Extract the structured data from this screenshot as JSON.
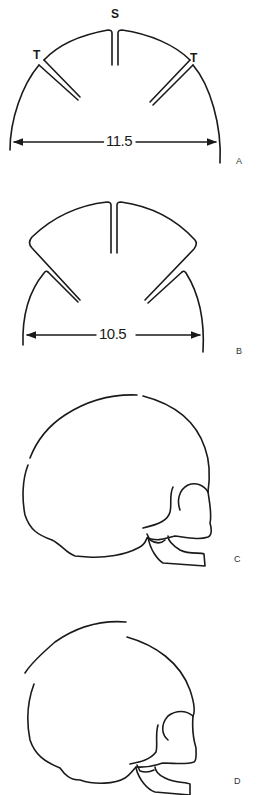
{
  "panels": [
    {
      "id": "A",
      "panel_label": "A",
      "suture_labels": {
        "sagittal": "S",
        "temporal_left": "T",
        "temporal_right": "T"
      },
      "measurement": "11.5"
    },
    {
      "id": "B",
      "panel_label": "B",
      "measurement": "10.5"
    },
    {
      "id": "C",
      "panel_label": "C",
      "description": "skull lateral view outline"
    },
    {
      "id": "D",
      "panel_label": "D",
      "description": "skull lateral view outline"
    }
  ],
  "colors": {
    "ink": "#1a1a1a",
    "background": "#ffffff"
  }
}
